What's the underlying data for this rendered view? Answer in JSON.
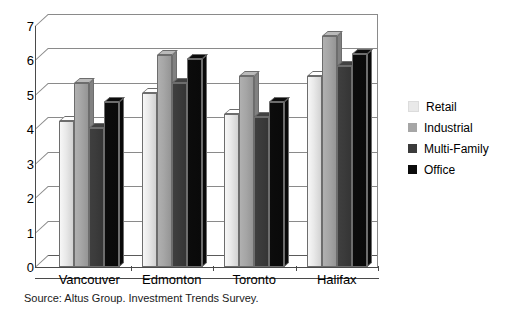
{
  "chart_data": {
    "type": "bar",
    "title": "",
    "subtitle": "",
    "xlabel": "",
    "ylabel": "",
    "ylim": [
      0,
      7
    ],
    "ytick_labels": [
      "0",
      "1",
      "2",
      "3",
      "4",
      "5",
      "6",
      "7"
    ],
    "ytick_values": [
      0,
      1,
      2,
      3,
      4,
      5,
      6,
      7
    ],
    "grid": true,
    "legend_position": "right",
    "style": "3d-clustered-column",
    "categories": [
      "Vancouver",
      "Edmonton",
      "Toronto",
      "Halifax"
    ],
    "series": [
      {
        "name": "Retail",
        "color": "#e9e9e9",
        "values": [
          4.25,
          5.05,
          4.45,
          5.55
        ]
      },
      {
        "name": "Industrial",
        "color": "#a6a6a6",
        "values": [
          5.35,
          6.15,
          5.55,
          6.7
        ]
      },
      {
        "name": "Multi-Family",
        "color": "#3b3b3b",
        "values": [
          4.05,
          5.35,
          4.35,
          5.85
        ]
      },
      {
        "name": "Office",
        "color": "#0b0b0b",
        "values": [
          4.8,
          6.05,
          4.8,
          6.2
        ]
      }
    ],
    "annotations": [
      "Source: Altus Group. Investment Trends Survey."
    ]
  },
  "legend": {
    "items": [
      {
        "label": "Retail",
        "color": "#e9e9e9"
      },
      {
        "label": "Industrial",
        "color": "#a6a6a6"
      },
      {
        "label": "Multi-Family",
        "color": "#3b3b3b"
      },
      {
        "label": "Office",
        "color": "#0b0b0b"
      }
    ]
  },
  "footer": {
    "source": "Source: Altus Group. Investment Trends Survey."
  },
  "colors": {
    "retail": "#e9e9e9",
    "industrial": "#a6a6a6",
    "multi_family": "#3b3b3b",
    "office": "#0b0b0b",
    "gridline": "#8a8a8a",
    "axis": "#4a4a4a",
    "background": "#ffffff"
  }
}
